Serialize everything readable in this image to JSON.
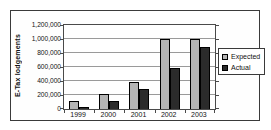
{
  "chart_data": {
    "type": "bar",
    "title": "",
    "ylabel": "E-Tax lodgements",
    "xlabel": "",
    "categories": [
      "1999",
      "2000",
      "2001",
      "2002",
      "2003"
    ],
    "series": [
      {
        "name": "Expected",
        "color": "#b5b5b5",
        "values": [
          110000,
          210000,
          380000,
          1000000,
          1000000
        ]
      },
      {
        "name": "Actual",
        "color": "#2b2b2b",
        "values": [
          30000,
          110000,
          280000,
          580000,
          880000
        ]
      }
    ],
    "ylim": [
      0,
      1200000
    ],
    "ytick_step": 200000,
    "ytick_labels": [
      "0",
      "200,000",
      "400,000",
      "600,000",
      "800,000",
      "1,000,000",
      "1,200,000"
    ],
    "grid": true,
    "legend_position": "right",
    "colors": {
      "frame_border": "#3a3a3a",
      "plot_border": "#4a4a4a",
      "gridline": "#9a9a9a",
      "background": "#ffffff"
    }
  }
}
